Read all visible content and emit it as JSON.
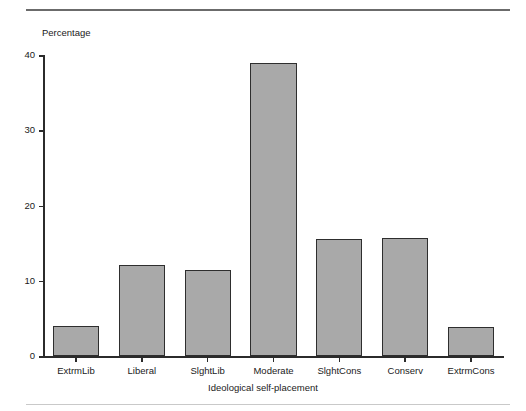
{
  "figure": {
    "top_caption_ghost": "",
    "background_color": "#ffffff"
  },
  "chart_data": {
    "type": "bar",
    "title": "",
    "xlabel": "Ideological self-placement",
    "ylabel": "Percentage",
    "categories": [
      "ExtrmLib",
      "Liberal",
      "SlghtLib",
      "Moderate",
      "SlghtCons",
      "Conserv",
      "ExtrmCons"
    ],
    "values": [
      4.0,
      12.1,
      11.4,
      38.9,
      15.6,
      15.7,
      3.9
    ],
    "ylim": [
      0,
      40
    ],
    "yticks": [
      0,
      10,
      20,
      30,
      40
    ],
    "ytick_labels": [
      "0",
      "10",
      "20",
      "30",
      "40"
    ],
    "grid": false,
    "legend": null,
    "bar_fill_color": "#a9a9a9",
    "bar_edge_color": "#2e2e2e",
    "axis_color": "#2b2b2b"
  }
}
